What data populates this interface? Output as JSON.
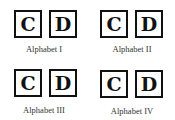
{
  "panels": [
    {
      "letters": [
        "C",
        "D"
      ],
      "label": "Alphabet I"
    },
    {
      "letters": [
        "C",
        "D"
      ],
      "label": "Alphabet II"
    },
    {
      "letters": [
        "C",
        "D"
      ],
      "label": "Alphabet III"
    },
    {
      "letters": [
        "C",
        "D"
      ],
      "label": "Alphabet IV"
    }
  ]
}
